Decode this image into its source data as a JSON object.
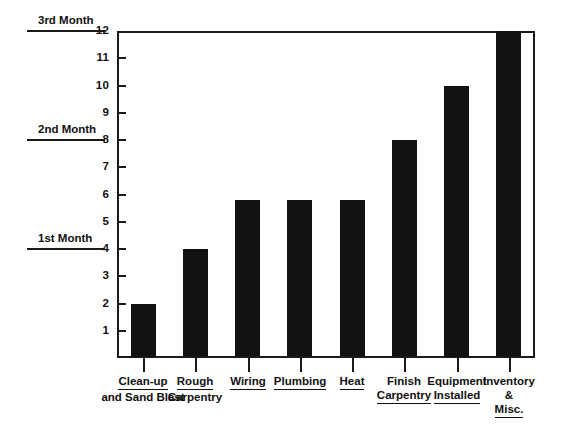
{
  "chart_data": {
    "type": "bar",
    "title": "",
    "subtitle": "",
    "xlabel": "",
    "ylabel": "",
    "ylim": [
      0,
      12
    ],
    "ytick_values": [
      1,
      2,
      3,
      4,
      5,
      6,
      7,
      8,
      9,
      10,
      11,
      12
    ],
    "ytick_labels": [
      "1",
      "2",
      "3",
      "4",
      "5",
      "6",
      "7",
      "8",
      "9",
      "10",
      "11",
      "12"
    ],
    "grid": false,
    "legend": null,
    "categories": [
      "Clean-up and Sand Blast",
      "Rough Carpentry",
      "Wiring",
      "Plumbing",
      "Heat",
      "Finish Carpentry",
      "Equipment Installed",
      "Inventory & Misc."
    ],
    "values": [
      2,
      4,
      5.8,
      5.8,
      5.8,
      8,
      10,
      12
    ],
    "bar_color": "#111111",
    "annotations": [
      {
        "label": "1st Month",
        "y": 4
      },
      {
        "label": "2nd Month",
        "y": 8
      },
      {
        "label": "3rd Month",
        "y": 12
      }
    ]
  },
  "axis": {
    "y_ticks": [
      {
        "label": "12",
        "value": 12
      },
      {
        "label": "11",
        "value": 11
      },
      {
        "label": "10",
        "value": 10
      },
      {
        "label": "9",
        "value": 9
      },
      {
        "label": "8",
        "value": 8
      },
      {
        "label": "7",
        "value": 7
      },
      {
        "label": "6",
        "value": 6
      },
      {
        "label": "5",
        "value": 5
      },
      {
        "label": "4",
        "value": 4
      },
      {
        "label": "3",
        "value": 3
      },
      {
        "label": "2",
        "value": 2
      },
      {
        "label": "1",
        "value": 1
      }
    ]
  },
  "month_markers": [
    {
      "label": "3rd Month",
      "value": 12
    },
    {
      "label": "2nd Month",
      "value": 8
    },
    {
      "label": "1st Month",
      "value": 4
    }
  ],
  "categories": [
    {
      "lines": [
        "Clean-up",
        "and Sand Blast"
      ],
      "underline_line": 0,
      "value": 2
    },
    {
      "lines": [
        "Rough",
        "Carpentry"
      ],
      "underline_line": 0,
      "value": 4
    },
    {
      "lines": [
        "Wiring"
      ],
      "underline_line": 0,
      "value": 5.8
    },
    {
      "lines": [
        "Plumbing"
      ],
      "underline_line": 0,
      "value": 5.8
    },
    {
      "lines": [
        "Heat"
      ],
      "underline_line": 0,
      "value": 5.8
    },
    {
      "lines": [
        "Finish",
        "Carpentry"
      ],
      "underline_line": 1,
      "value": 8
    },
    {
      "lines": [
        "Equipment",
        "Installed"
      ],
      "underline_line": 1,
      "value": 10
    },
    {
      "lines": [
        "Inventory",
        "&",
        "Misc."
      ],
      "underline_line": 2,
      "value": 12
    }
  ],
  "colors": {
    "bar": "#111111",
    "axis": "#1a1a1a",
    "background": "#ffffff",
    "text": "#111111"
  }
}
